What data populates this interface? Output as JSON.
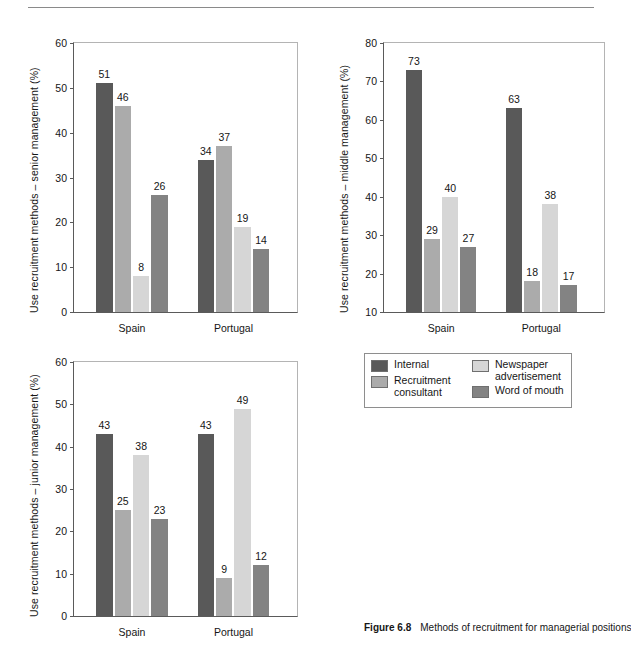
{
  "page": {
    "rule": "horizontal-rule"
  },
  "caption": {
    "figure_number": "Figure 6.8",
    "text": "Methods of recruitment for managerial positions"
  },
  "legend": {
    "title": "",
    "entries": [
      {
        "label": "Internal",
        "color": "#595959"
      },
      {
        "label": "Recruitment\nconsultant",
        "color": "#ababab"
      },
      {
        "label": "Newspaper\nadvertisement",
        "color": "#d6d6d6"
      },
      {
        "label": "Word of mouth",
        "color": "#838383"
      }
    ]
  },
  "chart_data": [
    {
      "id": "senior",
      "type": "bar",
      "title": "",
      "xlabel": "",
      "ylabel": "Use recruitment methods – senior management (%)",
      "categories": [
        "Spain",
        "Portugal"
      ],
      "yticks": [
        0,
        10,
        20,
        30,
        40,
        50,
        60
      ],
      "ylim": [
        0,
        60
      ],
      "grid": false,
      "legend_position": "external",
      "series": [
        {
          "name": "Internal",
          "color": "#595959",
          "values": [
            51,
            34
          ]
        },
        {
          "name": "Recruitment consultant",
          "color": "#ababab",
          "values": [
            46,
            37
          ]
        },
        {
          "name": "Newspaper advertisement",
          "color": "#d6d6d6",
          "values": [
            8,
            19
          ]
        },
        {
          "name": "Word of mouth",
          "color": "#838383",
          "values": [
            26,
            14
          ]
        }
      ]
    },
    {
      "id": "middle",
      "type": "bar",
      "title": "",
      "xlabel": "",
      "ylabel": "Use recruitment methods – middle management (%)",
      "categories": [
        "Spain",
        "Portugal"
      ],
      "yticks": [
        10,
        20,
        30,
        40,
        50,
        60,
        70,
        80
      ],
      "ylim": [
        10,
        80
      ],
      "grid": false,
      "legend_position": "external",
      "series": [
        {
          "name": "Internal",
          "color": "#595959",
          "values": [
            73,
            63
          ]
        },
        {
          "name": "Recruitment consultant",
          "color": "#ababab",
          "values": [
            29,
            18
          ]
        },
        {
          "name": "Newspaper advertisement",
          "color": "#d6d6d6",
          "values": [
            40,
            38
          ]
        },
        {
          "name": "Word of mouth",
          "color": "#838383",
          "values": [
            27,
            17
          ]
        }
      ]
    },
    {
      "id": "junior",
      "type": "bar",
      "title": "",
      "xlabel": "",
      "ylabel": "Use recruitment methods – junior management (%)",
      "categories": [
        "Spain",
        "Portugal"
      ],
      "yticks": [
        0,
        10,
        20,
        30,
        40,
        50,
        60
      ],
      "ylim": [
        0,
        60
      ],
      "grid": false,
      "legend_position": "external",
      "series": [
        {
          "name": "Internal",
          "color": "#595959",
          "values": [
            43,
            43
          ]
        },
        {
          "name": "Recruitment consultant",
          "color": "#ababab",
          "values": [
            25,
            9
          ]
        },
        {
          "name": "Newspaper advertisement",
          "color": "#d6d6d6",
          "values": [
            38,
            49
          ]
        },
        {
          "name": "Word of mouth",
          "color": "#838383",
          "values": [
            23,
            12
          ]
        }
      ]
    }
  ]
}
